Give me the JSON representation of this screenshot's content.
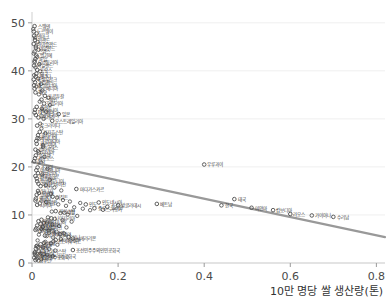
{
  "chart_data": {
    "type": "scatter",
    "title": "",
    "xlabel": "10만 명당 쌀 생산량(톤)",
    "ylabel": "",
    "xlim": [
      0,
      0.82
    ],
    "ylim": [
      0,
      51
    ],
    "xticks": [
      "0",
      "0.2",
      "0.4",
      "0.6",
      "0.8"
    ],
    "xtick_values": [
      0,
      0.2,
      0.4,
      0.6,
      0.8
    ],
    "yticks": [
      "0",
      "10",
      "20",
      "30",
      "40",
      "50"
    ],
    "ytick_values": [
      0,
      10,
      20,
      30,
      40,
      50
    ],
    "grid": "horizontal",
    "legend": "none",
    "marker": "open-circle",
    "marker_color": "#555555",
    "trendline": {
      "color": "#999999",
      "width": 2.2,
      "x0": 0.0,
      "y0": 21.0,
      "x1": 0.82,
      "y1": 5.4
    },
    "points": [
      {
        "label": "스웨덴",
        "x": 0.006,
        "y": 49.3
      },
      {
        "label": "노르웨이",
        "x": 0.004,
        "y": 48.2
      },
      {
        "label": "덴마크",
        "x": 0.005,
        "y": 47.3
      },
      {
        "label": "핀란드",
        "x": 0.007,
        "y": 46.4
      },
      {
        "label": "아이슬란드",
        "x": 0.004,
        "y": 45.6
      },
      {
        "label": "네덜란드",
        "x": 0.009,
        "y": 44.8
      },
      {
        "label": "스위스",
        "x": 0.006,
        "y": 44.0
      },
      {
        "label": "벨기에",
        "x": 0.01,
        "y": 43.2
      },
      {
        "label": "독일",
        "x": 0.008,
        "y": 42.5
      },
      {
        "label": "오스트리아",
        "x": 0.006,
        "y": 41.8
      },
      {
        "label": "아일랜드",
        "x": 0.005,
        "y": 41.1
      },
      {
        "label": "프랑스",
        "x": 0.012,
        "y": 40.2
      },
      {
        "label": "영국",
        "x": 0.01,
        "y": 39.4
      },
      {
        "label": "캐나다",
        "x": 0.009,
        "y": 38.8
      },
      {
        "label": "룩셈부르크",
        "x": 0.004,
        "y": 38.2
      },
      {
        "label": "뉴질랜드",
        "x": 0.007,
        "y": 37.6
      },
      {
        "label": "에스토니아",
        "x": 0.005,
        "y": 37.0
      },
      {
        "label": "슬로베니아",
        "x": 0.006,
        "y": 36.3
      },
      {
        "label": "체코",
        "x": 0.008,
        "y": 35.5
      },
      {
        "label": "포르투갈",
        "x": 0.03,
        "y": 34.8
      },
      {
        "label": "스페인",
        "x": 0.022,
        "y": 34.0
      },
      {
        "label": "이탈리아",
        "x": 0.028,
        "y": 33.2
      },
      {
        "label": "폴란드",
        "x": 0.011,
        "y": 32.5
      },
      {
        "label": "리투아니아",
        "x": 0.007,
        "y": 31.9
      },
      {
        "label": "라트비아",
        "x": 0.006,
        "y": 31.3
      },
      {
        "label": "슬로바키아",
        "x": 0.009,
        "y": 30.8
      },
      {
        "label": "헝가리",
        "x": 0.015,
        "y": 30.3
      },
      {
        "label": "일본",
        "x": 0.062,
        "y": 31.0
      },
      {
        "label": "오스트레일리아",
        "x": 0.047,
        "y": 29.6
      },
      {
        "label": "우크라이나",
        "x": 0.012,
        "y": 28.6
      },
      {
        "label": "카자흐스탄",
        "x": 0.018,
        "y": 27.3
      },
      {
        "label": "불가리아",
        "x": 0.014,
        "y": 26.6
      },
      {
        "label": "루마니아",
        "x": 0.013,
        "y": 26.0
      },
      {
        "label": "크로아티아",
        "x": 0.01,
        "y": 25.4
      },
      {
        "label": "세르비아",
        "x": 0.011,
        "y": 24.8
      },
      {
        "label": "그리스",
        "x": 0.026,
        "y": 24.2
      },
      {
        "label": "벨라루스",
        "x": 0.008,
        "y": 23.6
      },
      {
        "label": "러시아",
        "x": 0.016,
        "y": 23.0
      },
      {
        "label": "몰도바",
        "x": 0.009,
        "y": 22.4
      },
      {
        "label": "키프로스",
        "x": 0.007,
        "y": 21.8
      },
      {
        "label": "몰타",
        "x": 0.005,
        "y": 21.2
      },
      {
        "label": "우루과이",
        "x": 0.4,
        "y": 20.5
      },
      {
        "label": "조지아",
        "x": 0.013,
        "y": 19.9
      },
      {
        "label": "아르메니아",
        "x": 0.01,
        "y": 19.3
      },
      {
        "label": "알바니아",
        "x": 0.014,
        "y": 18.7
      },
      {
        "label": "몬테네그로",
        "x": 0.008,
        "y": 18.1
      },
      {
        "label": "보스니아",
        "x": 0.011,
        "y": 17.6
      },
      {
        "label": "북마케도니아",
        "x": 0.012,
        "y": 17.0
      },
      {
        "label": "아제르바이잔",
        "x": 0.015,
        "y": 16.5
      },
      {
        "label": "터키",
        "x": 0.02,
        "y": 16.0
      },
      {
        "label": "마다가스카르",
        "x": 0.103,
        "y": 15.4
      },
      {
        "label": "튀니지",
        "x": 0.014,
        "y": 15.0
      },
      {
        "label": "모로코",
        "x": 0.016,
        "y": 14.6
      },
      {
        "label": "알제리",
        "x": 0.011,
        "y": 14.2
      },
      {
        "label": "이집트",
        "x": 0.048,
        "y": 13.8
      },
      {
        "label": "요르단",
        "x": 0.009,
        "y": 13.4
      },
      {
        "label": "레바논",
        "x": 0.008,
        "y": 13.0
      },
      {
        "label": "이란",
        "x": 0.033,
        "y": 12.7
      },
      {
        "label": "이라크",
        "x": 0.018,
        "y": 12.4
      },
      {
        "label": "시리아",
        "x": 0.012,
        "y": 12.1
      },
      {
        "label": "인도네시아",
        "x": 0.155,
        "y": 12.6
      },
      {
        "label": "인도",
        "x": 0.125,
        "y": 12.2
      },
      {
        "label": "방글라데시",
        "x": 0.2,
        "y": 12.0
      },
      {
        "label": "베트남",
        "x": 0.29,
        "y": 12.3
      },
      {
        "label": "태국",
        "x": 0.47,
        "y": 13.3
      },
      {
        "label": "한국",
        "x": 0.44,
        "y": 12.0
      },
      {
        "label": "미얀마",
        "x": 0.51,
        "y": 11.5
      },
      {
        "label": "캄보디아",
        "x": 0.56,
        "y": 11.0
      },
      {
        "label": "필리핀",
        "x": 0.175,
        "y": 11.7
      },
      {
        "label": "중국",
        "x": 0.145,
        "y": 11.4
      },
      {
        "label": "스리랑카",
        "x": 0.165,
        "y": 11.1
      },
      {
        "label": "파키스탄",
        "x": 0.055,
        "y": 10.8
      },
      {
        "label": "네팔",
        "x": 0.075,
        "y": 10.5
      },
      {
        "label": "라오스",
        "x": 0.6,
        "y": 10.2
      },
      {
        "label": "가이아나",
        "x": 0.65,
        "y": 9.9
      },
      {
        "label": "수리남",
        "x": 0.7,
        "y": 9.6
      },
      {
        "label": "나이지리아",
        "x": 0.045,
        "y": 9.3
      },
      {
        "label": "가나",
        "x": 0.022,
        "y": 9.0
      },
      {
        "label": "케냐",
        "x": 0.015,
        "y": 8.7
      },
      {
        "label": "탄자니아",
        "x": 0.035,
        "y": 8.4
      },
      {
        "label": "우간다",
        "x": 0.02,
        "y": 8.1
      },
      {
        "label": "에티오피아",
        "x": 0.012,
        "y": 7.8
      },
      {
        "label": "모잠비크",
        "x": 0.025,
        "y": 7.5
      },
      {
        "label": "잠비아",
        "x": 0.01,
        "y": 7.2
      },
      {
        "label": "짐바브웨",
        "x": 0.008,
        "y": 6.9
      },
      {
        "label": "말라위",
        "x": 0.018,
        "y": 6.6
      },
      {
        "label": "세네갈",
        "x": 0.04,
        "y": 6.3
      },
      {
        "label": "말리",
        "x": 0.065,
        "y": 6.0
      },
      {
        "label": "부르키나파소",
        "x": 0.03,
        "y": 5.7
      },
      {
        "label": "기니",
        "x": 0.085,
        "y": 5.4
      },
      {
        "label": "시에라리온",
        "x": 0.095,
        "y": 5.1
      },
      {
        "label": "라이베리아",
        "x": 0.055,
        "y": 4.8
      },
      {
        "label": "코트디부아르",
        "x": 0.05,
        "y": 4.5
      },
      {
        "label": "베냉",
        "x": 0.028,
        "y": 4.2
      },
      {
        "label": "토고",
        "x": 0.02,
        "y": 3.9
      },
      {
        "label": "니제르",
        "x": 0.012,
        "y": 3.6
      },
      {
        "label": "차드",
        "x": 0.014,
        "y": 3.3
      },
      {
        "label": "수단",
        "x": 0.009,
        "y": 3.0
      },
      {
        "label": "조선민주주의인민공화국",
        "x": 0.095,
        "y": 2.7
      },
      {
        "label": "아프가니스탄",
        "x": 0.016,
        "y": 2.4
      },
      {
        "label": "예멘",
        "x": 0.006,
        "y": 2.1
      },
      {
        "label": "소말리아",
        "x": 0.007,
        "y": 1.8
      },
      {
        "label": "중앙아프리카공화국",
        "x": 0.01,
        "y": 1.5
      },
      {
        "label": "콩고민주공화국",
        "x": 0.013,
        "y": 1.2
      },
      {
        "label": "부룬디",
        "x": 0.011,
        "y": 0.9
      },
      {
        "label": "남수단",
        "x": 0.008,
        "y": 0.6
      }
    ],
    "extra_points": [
      {
        "x": 0.003,
        "y": 48.7
      },
      {
        "x": 0.011,
        "y": 47.8
      },
      {
        "x": 0.007,
        "y": 46.9
      },
      {
        "x": 0.013,
        "y": 46.0
      },
      {
        "x": 0.009,
        "y": 45.1
      },
      {
        "x": 0.015,
        "y": 44.4
      },
      {
        "x": 0.004,
        "y": 43.6
      },
      {
        "x": 0.012,
        "y": 42.9
      },
      {
        "x": 0.006,
        "y": 42.1
      },
      {
        "x": 0.017,
        "y": 41.4
      },
      {
        "x": 0.008,
        "y": 40.7
      },
      {
        "x": 0.019,
        "y": 39.9
      },
      {
        "x": 0.005,
        "y": 39.1
      },
      {
        "x": 0.014,
        "y": 38.4
      },
      {
        "x": 0.021,
        "y": 37.3
      },
      {
        "x": 0.01,
        "y": 36.7
      },
      {
        "x": 0.024,
        "y": 35.9
      },
      {
        "x": 0.016,
        "y": 35.1
      },
      {
        "x": 0.038,
        "y": 34.4
      },
      {
        "x": 0.018,
        "y": 33.6
      },
      {
        "x": 0.042,
        "y": 32.9
      },
      {
        "x": 0.023,
        "y": 32.1
      },
      {
        "x": 0.033,
        "y": 31.5
      },
      {
        "x": 0.027,
        "y": 30.0
      },
      {
        "x": 0.019,
        "y": 29.0
      },
      {
        "x": 0.022,
        "y": 28.0
      },
      {
        "x": 0.031,
        "y": 27.0
      },
      {
        "x": 0.017,
        "y": 25.9
      },
      {
        "x": 0.026,
        "y": 24.5
      },
      {
        "x": 0.014,
        "y": 23.3
      },
      {
        "x": 0.029,
        "y": 22.1
      },
      {
        "x": 0.021,
        "y": 20.9
      },
      {
        "x": 0.036,
        "y": 19.6
      },
      {
        "x": 0.024,
        "y": 18.4
      },
      {
        "x": 0.041,
        "y": 17.3
      },
      {
        "x": 0.032,
        "y": 16.2
      },
      {
        "x": 0.052,
        "y": 15.7
      },
      {
        "x": 0.068,
        "y": 15.1
      },
      {
        "x": 0.044,
        "y": 14.4
      },
      {
        "x": 0.058,
        "y": 13.6
      },
      {
        "x": 0.072,
        "y": 13.1
      },
      {
        "x": 0.088,
        "y": 12.8
      },
      {
        "x": 0.112,
        "y": 12.5
      },
      {
        "x": 0.061,
        "y": 12.2
      },
      {
        "x": 0.079,
        "y": 11.9
      },
      {
        "x": 0.098,
        "y": 11.6
      },
      {
        "x": 0.118,
        "y": 11.3
      },
      {
        "x": 0.135,
        "y": 11.0
      },
      {
        "x": 0.046,
        "y": 10.7
      },
      {
        "x": 0.066,
        "y": 10.4
      },
      {
        "x": 0.083,
        "y": 10.1
      },
      {
        "x": 0.105,
        "y": 9.8
      },
      {
        "x": 0.037,
        "y": 9.5
      },
      {
        "x": 0.053,
        "y": 9.2
      },
      {
        "x": 0.071,
        "y": 8.9
      },
      {
        "x": 0.092,
        "y": 8.6
      },
      {
        "x": 0.028,
        "y": 8.3
      },
      {
        "x": 0.047,
        "y": 8.0
      },
      {
        "x": 0.063,
        "y": 7.7
      },
      {
        "x": 0.08,
        "y": 7.4
      },
      {
        "x": 0.021,
        "y": 7.1
      },
      {
        "x": 0.039,
        "y": 6.8
      },
      {
        "x": 0.057,
        "y": 6.5
      },
      {
        "x": 0.074,
        "y": 6.2
      },
      {
        "x": 0.016,
        "y": 5.9
      },
      {
        "x": 0.034,
        "y": 5.6
      },
      {
        "x": 0.049,
        "y": 5.3
      },
      {
        "x": 0.067,
        "y": 5.0
      },
      {
        "x": 0.013,
        "y": 4.7
      },
      {
        "x": 0.031,
        "y": 4.4
      },
      {
        "x": 0.044,
        "y": 4.1
      },
      {
        "x": 0.059,
        "y": 3.8
      },
      {
        "x": 0.01,
        "y": 3.5
      },
      {
        "x": 0.026,
        "y": 3.2
      },
      {
        "x": 0.04,
        "y": 2.9
      },
      {
        "x": 0.054,
        "y": 2.6
      },
      {
        "x": 0.007,
        "y": 2.3
      },
      {
        "x": 0.019,
        "y": 2.0
      },
      {
        "x": 0.035,
        "y": 1.7
      },
      {
        "x": 0.048,
        "y": 1.4
      },
      {
        "x": 0.005,
        "y": 1.1
      },
      {
        "x": 0.022,
        "y": 0.8
      },
      {
        "x": 0.015,
        "y": 0.5
      }
    ]
  }
}
